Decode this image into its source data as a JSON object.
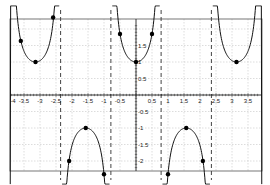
{
  "chart_data": {
    "type": "line",
    "title": "",
    "xlabel": "",
    "ylabel": "",
    "function": "y = sec(2x)",
    "xlim": [
      -3.93,
      3.93
    ],
    "ylim": [
      -2.3,
      2.3
    ],
    "grid": true,
    "legend": null,
    "x_ticks": [
      -4,
      -3.5,
      -3,
      -2.5,
      -2,
      -1.5,
      -1,
      -0.5,
      0.5,
      1,
      1.5,
      2,
      2.5,
      3,
      3.5
    ],
    "x_tick_labels": [
      "-4",
      "-3.5",
      "-3",
      "-2.5",
      "-2",
      "-1.5",
      "-1",
      "-0.5",
      "0.5",
      "1",
      "1.5",
      "2",
      "2.5",
      "3",
      "3.5"
    ],
    "y_ticks": [
      1.5,
      1,
      0.5,
      -0.5,
      -1,
      -1.5,
      -2
    ],
    "y_tick_labels": [
      "1.5",
      "1",
      "0.5",
      "-0.5",
      "-1",
      "-1.5",
      "-2"
    ],
    "asymptotes": [
      -2.356,
      -0.785,
      0.785,
      2.356
    ],
    "series": [
      {
        "name": "sec(2x)",
        "color": "#111111",
        "branches": [
          [
            -3.93,
            -2.4
          ],
          [
            -2.31,
            -0.83
          ],
          [
            -0.74,
            0.74
          ],
          [
            0.83,
            2.31
          ],
          [
            2.4,
            3.93
          ]
        ]
      }
    ],
    "points": [
      {
        "x": -3.6,
        "y": 1.64
      },
      {
        "x": -3.14,
        "y": 1.0
      },
      {
        "x": -2.59,
        "y": 2.35
      },
      {
        "x": -2.09,
        "y": -2.0
      },
      {
        "x": -1.57,
        "y": -1.0
      },
      {
        "x": -1.0,
        "y": -2.4
      },
      {
        "x": -0.5,
        "y": 1.85
      },
      {
        "x": 0.0,
        "y": 1.0
      },
      {
        "x": 0.5,
        "y": 1.85
      },
      {
        "x": 1.0,
        "y": -2.4
      },
      {
        "x": 1.57,
        "y": -1.0
      },
      {
        "x": 2.09,
        "y": -2.0
      },
      {
        "x": 3.14,
        "y": 1.0
      }
    ]
  },
  "colors": {
    "curve": "#111111",
    "grid": "#b8b8b8",
    "frame": "#555555",
    "axis": "#222222",
    "asymptote": "#444444"
  }
}
